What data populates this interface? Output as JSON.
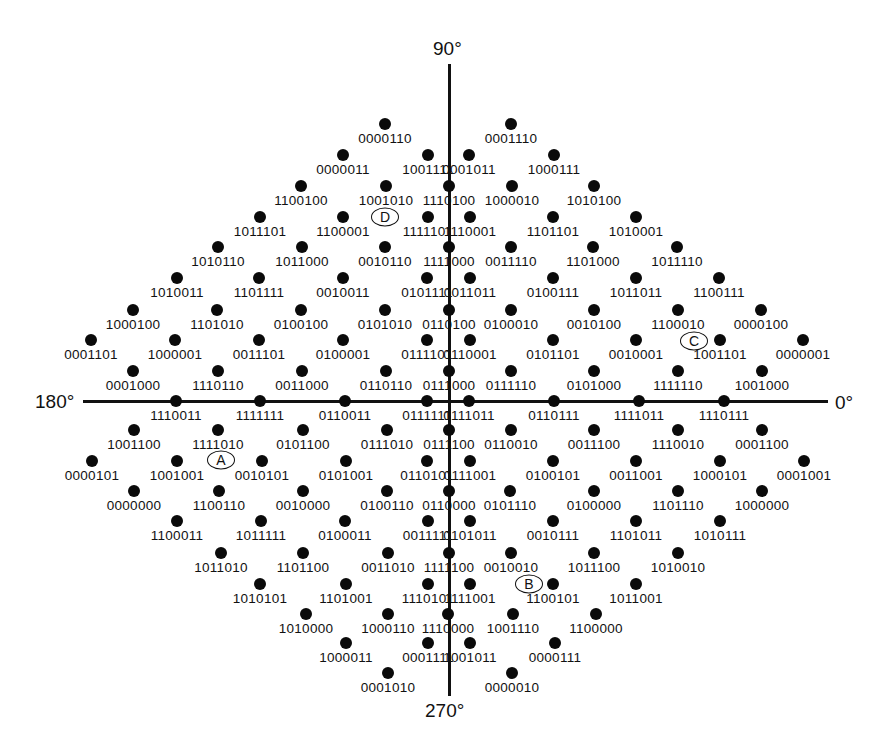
{
  "diagram": {
    "axes": {
      "top": "90°",
      "bottom": "270°",
      "left": "180°",
      "right": "0°"
    },
    "markers": [
      {
        "label": "D",
        "x": 385,
        "y": 217
      },
      {
        "label": "C",
        "x": 694,
        "y": 341
      },
      {
        "label": "A",
        "x": 221,
        "y": 460
      },
      {
        "label": "B",
        "x": 529,
        "y": 584
      }
    ],
    "points": [
      {
        "x": 385,
        "y": 124,
        "code": "0000110"
      },
      {
        "x": 511,
        "y": 124,
        "code": "0001110"
      },
      {
        "x": 343,
        "y": 155,
        "code": "0000011"
      },
      {
        "x": 428,
        "y": 155,
        "code": "1001111"
      },
      {
        "x": 469,
        "y": 155,
        "code": "0001011"
      },
      {
        "x": 554,
        "y": 155,
        "code": "1000111"
      },
      {
        "x": 301,
        "y": 186,
        "code": "1100100"
      },
      {
        "x": 386,
        "y": 186,
        "code": "1001010"
      },
      {
        "x": 449,
        "y": 186,
        "code": "1110100"
      },
      {
        "x": 512,
        "y": 186,
        "code": "1000010"
      },
      {
        "x": 594,
        "y": 186,
        "code": "1010100"
      },
      {
        "x": 260,
        "y": 217,
        "code": "1011101"
      },
      {
        "x": 343,
        "y": 217,
        "code": "1100001"
      },
      {
        "x": 428,
        "y": 217,
        "code": "1111101"
      },
      {
        "x": 470,
        "y": 217,
        "code": "1110001"
      },
      {
        "x": 553,
        "y": 217,
        "code": "1101101"
      },
      {
        "x": 636,
        "y": 217,
        "code": "1010001"
      },
      {
        "x": 218,
        "y": 247,
        "code": "1010110"
      },
      {
        "x": 302,
        "y": 247,
        "code": "1011000"
      },
      {
        "x": 385,
        "y": 247,
        "code": "0010110"
      },
      {
        "x": 449,
        "y": 247,
        "code": "1111000"
      },
      {
        "x": 511,
        "y": 247,
        "code": "0011110"
      },
      {
        "x": 593,
        "y": 247,
        "code": "1101000"
      },
      {
        "x": 677,
        "y": 247,
        "code": "1011110"
      },
      {
        "x": 177,
        "y": 278,
        "code": "1010011"
      },
      {
        "x": 259,
        "y": 278,
        "code": "1101111"
      },
      {
        "x": 343,
        "y": 278,
        "code": "0010011"
      },
      {
        "x": 427,
        "y": 278,
        "code": "0101111"
      },
      {
        "x": 470,
        "y": 278,
        "code": "0011011"
      },
      {
        "x": 553,
        "y": 278,
        "code": "0100111"
      },
      {
        "x": 636,
        "y": 278,
        "code": "1011011"
      },
      {
        "x": 719,
        "y": 278,
        "code": "1100111"
      },
      {
        "x": 133,
        "y": 310,
        "code": "1000100"
      },
      {
        "x": 217,
        "y": 310,
        "code": "1101010"
      },
      {
        "x": 301,
        "y": 310,
        "code": "0100100"
      },
      {
        "x": 385,
        "y": 310,
        "code": "0101010"
      },
      {
        "x": 449,
        "y": 310,
        "code": "0110100"
      },
      {
        "x": 511,
        "y": 310,
        "code": "0100010"
      },
      {
        "x": 594,
        "y": 310,
        "code": "0010100"
      },
      {
        "x": 678,
        "y": 310,
        "code": "1100010"
      },
      {
        "x": 761,
        "y": 310,
        "code": "0000100"
      },
      {
        "x": 91,
        "y": 340,
        "code": "0001101"
      },
      {
        "x": 175,
        "y": 340,
        "code": "1000001"
      },
      {
        "x": 259,
        "y": 340,
        "code": "0011101"
      },
      {
        "x": 343,
        "y": 340,
        "code": "0100001"
      },
      {
        "x": 427,
        "y": 340,
        "code": "0111101"
      },
      {
        "x": 470,
        "y": 340,
        "code": "0110001"
      },
      {
        "x": 553,
        "y": 340,
        "code": "0101101"
      },
      {
        "x": 636,
        "y": 340,
        "code": "0010001"
      },
      {
        "x": 720,
        "y": 340,
        "code": "1001101"
      },
      {
        "x": 803,
        "y": 340,
        "code": "0000001"
      },
      {
        "x": 133,
        "y": 371,
        "code": "0001000"
      },
      {
        "x": 218,
        "y": 371,
        "code": "1110110"
      },
      {
        "x": 302,
        "y": 371,
        "code": "0011000"
      },
      {
        "x": 386,
        "y": 371,
        "code": "0110110"
      },
      {
        "x": 449,
        "y": 371,
        "code": "0111000"
      },
      {
        "x": 511,
        "y": 371,
        "code": "0111110"
      },
      {
        "x": 594,
        "y": 371,
        "code": "0101000"
      },
      {
        "x": 678,
        "y": 371,
        "code": "1111110"
      },
      {
        "x": 762,
        "y": 371,
        "code": "1001000"
      },
      {
        "x": 176,
        "y": 401,
        "code": "1110011"
      },
      {
        "x": 260,
        "y": 401,
        "code": "1111111"
      },
      {
        "x": 345,
        "y": 401,
        "code": "0110011"
      },
      {
        "x": 427,
        "y": 401,
        "code": "0111111"
      },
      {
        "x": 469,
        "y": 401,
        "code": "0111011"
      },
      {
        "x": 554,
        "y": 401,
        "code": "0110111"
      },
      {
        "x": 639,
        "y": 401,
        "code": "1111011"
      },
      {
        "x": 724,
        "y": 401,
        "code": "1110111"
      },
      {
        "x": 134,
        "y": 430,
        "code": "1001100"
      },
      {
        "x": 218,
        "y": 430,
        "code": "1111010"
      },
      {
        "x": 303,
        "y": 430,
        "code": "0101100"
      },
      {
        "x": 387,
        "y": 430,
        "code": "0111010"
      },
      {
        "x": 449,
        "y": 430,
        "code": "0111100"
      },
      {
        "x": 511,
        "y": 430,
        "code": "0110010"
      },
      {
        "x": 594,
        "y": 430,
        "code": "0011100"
      },
      {
        "x": 678,
        "y": 430,
        "code": "1110010"
      },
      {
        "x": 762,
        "y": 430,
        "code": "0001100"
      },
      {
        "x": 92,
        "y": 461,
        "code": "0000101"
      },
      {
        "x": 177,
        "y": 461,
        "code": "1001001"
      },
      {
        "x": 262,
        "y": 461,
        "code": "0010101"
      },
      {
        "x": 346,
        "y": 461,
        "code": "0101001"
      },
      {
        "x": 427,
        "y": 461,
        "code": "0110101"
      },
      {
        "x": 470,
        "y": 461,
        "code": "0111001"
      },
      {
        "x": 553,
        "y": 461,
        "code": "0100101"
      },
      {
        "x": 636,
        "y": 461,
        "code": "0011001"
      },
      {
        "x": 720,
        "y": 461,
        "code": "1000101"
      },
      {
        "x": 804,
        "y": 461,
        "code": "0001001"
      },
      {
        "x": 134,
        "y": 491,
        "code": "0000000"
      },
      {
        "x": 219,
        "y": 491,
        "code": "1100110"
      },
      {
        "x": 303,
        "y": 491,
        "code": "0010000"
      },
      {
        "x": 387,
        "y": 491,
        "code": "0100110"
      },
      {
        "x": 449,
        "y": 491,
        "code": "0110000"
      },
      {
        "x": 510,
        "y": 491,
        "code": "0101110"
      },
      {
        "x": 594,
        "y": 491,
        "code": "0100000"
      },
      {
        "x": 678,
        "y": 491,
        "code": "1101110"
      },
      {
        "x": 762,
        "y": 491,
        "code": "1000000"
      },
      {
        "x": 177,
        "y": 521,
        "code": "1100011"
      },
      {
        "x": 261,
        "y": 521,
        "code": "1011111"
      },
      {
        "x": 345,
        "y": 521,
        "code": "0100011"
      },
      {
        "x": 428,
        "y": 521,
        "code": "0011111"
      },
      {
        "x": 470,
        "y": 521,
        "code": "0101011"
      },
      {
        "x": 553,
        "y": 521,
        "code": "0010111"
      },
      {
        "x": 636,
        "y": 521,
        "code": "1101011"
      },
      {
        "x": 720,
        "y": 521,
        "code": "1010111"
      },
      {
        "x": 221,
        "y": 553,
        "code": "1011010"
      },
      {
        "x": 303,
        "y": 553,
        "code": "1101100"
      },
      {
        "x": 388,
        "y": 553,
        "code": "0011010"
      },
      {
        "x": 449,
        "y": 553,
        "code": "1111100"
      },
      {
        "x": 511,
        "y": 553,
        "code": "0010010"
      },
      {
        "x": 594,
        "y": 553,
        "code": "1011100"
      },
      {
        "x": 678,
        "y": 553,
        "code": "1010010"
      },
      {
        "x": 260,
        "y": 584,
        "code": "1010101"
      },
      {
        "x": 346,
        "y": 584,
        "code": "1101001"
      },
      {
        "x": 428,
        "y": 584,
        "code": "1110101"
      },
      {
        "x": 470,
        "y": 584,
        "code": "1111001"
      },
      {
        "x": 553,
        "y": 584,
        "code": "1100101"
      },
      {
        "x": 636,
        "y": 584,
        "code": "1011001"
      },
      {
        "x": 306,
        "y": 614,
        "code": "1010000"
      },
      {
        "x": 388,
        "y": 614,
        "code": "1000110"
      },
      {
        "x": 448,
        "y": 614,
        "code": "1110000"
      },
      {
        "x": 513,
        "y": 614,
        "code": "1001110"
      },
      {
        "x": 596,
        "y": 614,
        "code": "1100000"
      },
      {
        "x": 346,
        "y": 643,
        "code": "1000011"
      },
      {
        "x": 428,
        "y": 643,
        "code": "0001111"
      },
      {
        "x": 470,
        "y": 643,
        "code": "1001011"
      },
      {
        "x": 555,
        "y": 643,
        "code": "0000111"
      },
      {
        "x": 388,
        "y": 673,
        "code": "0001010"
      },
      {
        "x": 512,
        "y": 673,
        "code": "0000010"
      }
    ]
  }
}
